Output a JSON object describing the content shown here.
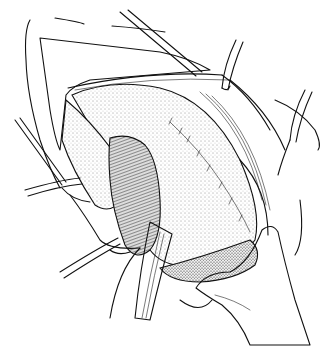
{
  "figure": {
    "style": "black ink line drawing with stippling",
    "colors": {
      "background": "#ffffff",
      "ink": "#111111",
      "stipple_light": "#e6e6e6",
      "stipple_dark": "#9a9a9a"
    },
    "elements": [
      "incision-skin-flap",
      "fat-layer",
      "retracted-organ",
      "dark-tissue-lobe",
      "suture-line",
      "retractor-upper-right",
      "retractor-right",
      "retractor-bottom",
      "forceps-left-upper",
      "forceps-left-lower",
      "instrument-top-diagonal",
      "gloved-hand-bottom-right"
    ]
  }
}
